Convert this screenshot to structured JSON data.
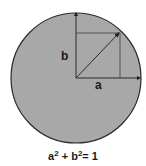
{
  "diagram": {
    "labels": {
      "a": "a",
      "b": "b"
    },
    "equation": {
      "base1": "a",
      "exp1": "2",
      "plus": " + ",
      "base2": "b",
      "exp2": "2",
      "equals": "= 1"
    },
    "colors": {
      "circle_fill": "#a8a8a8",
      "stroke": "#2a2a2a",
      "background": "#ffffff"
    },
    "geometry": {
      "center": [
        76,
        78
      ],
      "radius": 65,
      "vector_tip": [
        119,
        33
      ]
    }
  }
}
